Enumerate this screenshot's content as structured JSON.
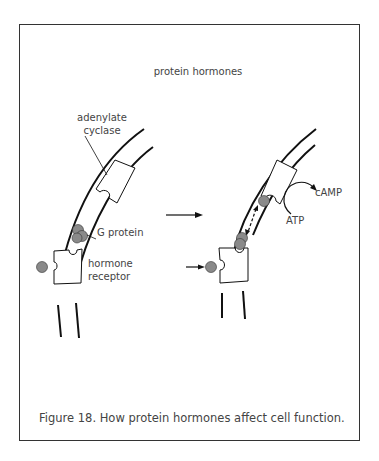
{
  "figure": {
    "title": "protein hormones",
    "caption": "Figure 18.  How protein hormones affect cell function.",
    "labels": {
      "adenylate_line1": "adenylate",
      "adenylate_line2": "cyclase",
      "g_protein": "G protein",
      "receptor_line1": "hormone",
      "receptor_line2": "receptor",
      "camp": "cAMP",
      "atp": "ATP"
    },
    "colors": {
      "line": "#111111",
      "molecule_fill": "#8a8a8a",
      "text": "#444444"
    }
  }
}
